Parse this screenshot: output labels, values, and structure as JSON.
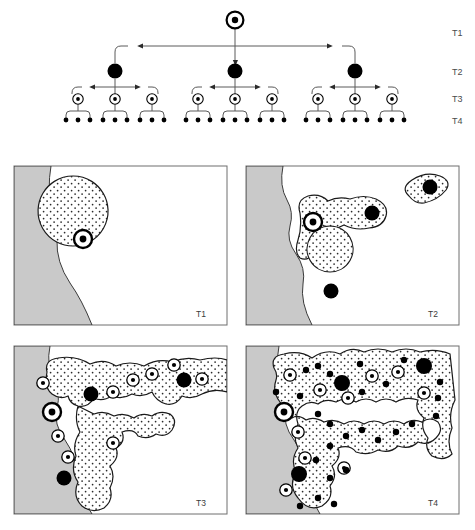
{
  "figure": {
    "type": "hierarchical-diffusion-diagram"
  },
  "tree": {
    "name": "hierarchical-diffusion-tree",
    "tier_labels": [
      "T1",
      "T2",
      "T3",
      "T4"
    ],
    "tier_label_x": 452,
    "tier_rows": [
      {
        "label": "T1",
        "label_y": 33,
        "node_y": 20,
        "node_kind": "origin-node",
        "count": 1
      },
      {
        "label": "T2",
        "label_y": 71,
        "node_y": 71,
        "node_kind": "t2-node",
        "count": 3
      },
      {
        "label": "T3",
        "label_y": 99,
        "node_y": 99,
        "node_kind": "t3-node",
        "count": 9
      },
      {
        "label": "T4",
        "label_y": 120,
        "node_y": 120,
        "node_kind": "t4-node",
        "count": 27
      }
    ],
    "root": {
      "x": 235,
      "y": 20
    },
    "t2_nodes": [
      {
        "x": 115
      },
      {
        "x": 235
      },
      {
        "x": 355
      }
    ],
    "t3_spacing": 37,
    "t4_spacing": 12,
    "bus_y_t1": 46,
    "bus_y_t2": 87,
    "bus_y_t3": 111,
    "node_styles": {
      "origin_outer_r": 8.5,
      "origin_ring_w": 2.2,
      "origin_inner_r": 3.2,
      "t2_r": 7.5,
      "t3_outer_r": 5.2,
      "t3_inner_r": 1.9,
      "t4_r": 2.4
    }
  },
  "panels": [
    {
      "name": "panel-t1",
      "label": "T1",
      "x": 14,
      "y": 166,
      "w": 213,
      "h": 159,
      "stage": 1,
      "caption_desc": "Single circular innovation region adjacent to coastline with origin node"
    },
    {
      "name": "panel-t2",
      "label": "T2",
      "x": 246,
      "y": 166,
      "w": 213,
      "h": 159,
      "stage": 2,
      "caption_desc": "Region branches to three secondary centres, one detached island region"
    },
    {
      "name": "panel-t3",
      "label": "T3",
      "x": 14,
      "y": 346,
      "w": 213,
      "h": 168,
      "stage": 3,
      "caption_desc": "Extensive dendritic network with many tertiary centres"
    },
    {
      "name": "panel-t4",
      "label": "T4",
      "x": 246,
      "y": 346,
      "w": 213,
      "h": 168,
      "stage": 4,
      "caption_desc": "Coalesced network enclosing an unfilled interior, dense small centres"
    }
  ],
  "colors": {
    "land": "#c9c9c9",
    "land_stroke": "#3a3a3a",
    "panel_border": "#6e6e6e",
    "region_fill": "#ffffff",
    "region_stroke": "#1a1a1a",
    "stipple": "#2a2a2a",
    "node_fill": "#000000",
    "link": "#5a5a5a",
    "label": "#3a3a3a"
  },
  "legend_semantics": {
    "origin-node": "T1 origin centre (heavy ring with solid core)",
    "t2-node": "T2 centre (large solid disc)",
    "t3-node": "T3 centre (thin ring with small core)",
    "t4-node": "T4 centre (small solid dot)"
  }
}
